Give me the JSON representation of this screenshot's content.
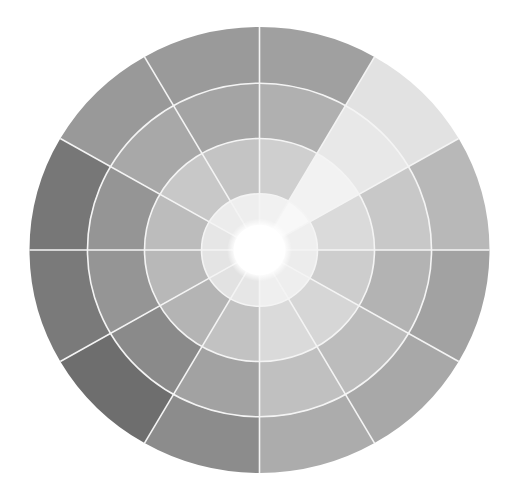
{
  "diagram": {
    "type": "segmented-radial-wheel",
    "center": {
      "x": 259.5,
      "y": 250
    },
    "radius_x": 230,
    "radius_y": 223,
    "ring_radii_fraction": [
      0.113,
      0.252,
      0.5,
      0.748,
      1.0
    ],
    "sector_count": 12,
    "sector_angle_deg": 30,
    "divider_color": "#f4f4f4",
    "center_color": "#ffffff",
    "sectors": [
      {
        "index": 0,
        "start_deg": 0,
        "rings": [
          "#f1f1f1",
          "#cfcfcf",
          "#b0b0b0",
          "#a0a0a0"
        ]
      },
      {
        "index": 1,
        "start_deg": 30,
        "rings": [
          "#f8f8f8",
          "#f2f2f2",
          "#e8e8e8",
          "#e2e2e2"
        ]
      },
      {
        "index": 2,
        "start_deg": 60,
        "rings": [
          "#efefef",
          "#dadada",
          "#c8c8c8",
          "#b8b8b8"
        ]
      },
      {
        "index": 3,
        "start_deg": 90,
        "rings": [
          "#ececec",
          "#cdcdcd",
          "#b3b3b3",
          "#a2a2a2"
        ]
      },
      {
        "index": 4,
        "start_deg": 120,
        "rings": [
          "#eeeeee",
          "#d6d6d6",
          "#bcbcbc",
          "#a8a8a8"
        ]
      },
      {
        "index": 5,
        "start_deg": 150,
        "rings": [
          "#efefef",
          "#dadada",
          "#c0c0c0",
          "#acacac"
        ]
      },
      {
        "index": 6,
        "start_deg": 180,
        "rings": [
          "#e6e6e6",
          "#c2c2c2",
          "#a2a2a2",
          "#8c8c8c"
        ]
      },
      {
        "index": 7,
        "start_deg": 210,
        "rings": [
          "#e2e2e2",
          "#b4b4b4",
          "#8a8a8a",
          "#6e6e6e"
        ]
      },
      {
        "index": 8,
        "start_deg": 240,
        "rings": [
          "#e4e4e4",
          "#b8b8b8",
          "#959595",
          "#7a7a7a"
        ]
      },
      {
        "index": 9,
        "start_deg": 270,
        "rings": [
          "#e6e6e6",
          "#bcbcbc",
          "#959595",
          "#777777"
        ]
      },
      {
        "index": 10,
        "start_deg": 300,
        "rings": [
          "#ececec",
          "#c8c8c8",
          "#a8a8a8",
          "#999999"
        ]
      },
      {
        "index": 11,
        "start_deg": 330,
        "rings": [
          "#eeeeee",
          "#c4c4c4",
          "#a4a4a4",
          "#9a9a9a"
        ]
      }
    ]
  }
}
